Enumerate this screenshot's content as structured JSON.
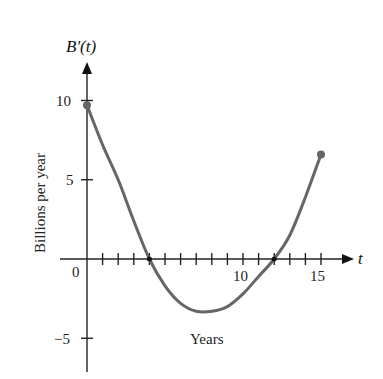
{
  "chart_data": {
    "type": "line",
    "title": "B′(t)",
    "xlabel": "Years",
    "ylabel": "Billions per year",
    "x_axis_name": "t",
    "x": [
      0,
      1,
      2,
      3,
      4,
      5,
      6,
      7,
      8,
      9,
      10,
      11,
      12,
      13,
      14,
      15
    ],
    "series": [
      {
        "name": "B′(t)",
        "values": [
          9.7,
          7.2,
          5.0,
          2.4,
          0.0,
          -1.7,
          -2.8,
          -3.3,
          -3.3,
          -3.0,
          -2.2,
          -1.1,
          0.0,
          1.5,
          3.9,
          6.6
        ],
        "color": "#666666",
        "endpoints_marked": true
      }
    ],
    "xlim": [
      0,
      15
    ],
    "ylim": [
      -5,
      10
    ],
    "x_ticks": [
      0,
      1,
      2,
      3,
      4,
      5,
      6,
      7,
      8,
      9,
      10,
      11,
      12,
      13,
      14,
      15
    ],
    "x_tick_labels": {
      "0": "0",
      "10": "10",
      "15": "15"
    },
    "y_ticks": [
      -5,
      0,
      5,
      10
    ],
    "y_tick_labels": [
      "−5",
      "0",
      "5",
      "10"
    ],
    "zero_crossings": [
      4,
      12
    ],
    "grid": false,
    "legend": "none"
  },
  "labels": {
    "title": "B′(t)",
    "ylabel": "Billions per year",
    "xlabel": "Years",
    "x_axis_name": "t",
    "ytick_10": "10",
    "ytick_5": "5",
    "ytick_0": "0",
    "ytick_m5": "−5",
    "xtick_10": "10",
    "xtick_15": "15"
  }
}
